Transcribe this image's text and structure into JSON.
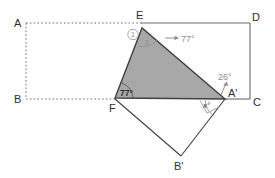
{
  "figure": {
    "colors": {
      "shaded_fill": "#a8a8a8",
      "solid_stroke": "#4a4a4a",
      "dotted_stroke": "#6e6e6e",
      "gray_annotation": "#8c8c8c",
      "label_text": "#2e2e2e",
      "background": "#ffffff"
    },
    "points": [
      {
        "name": "A",
        "label": "A",
        "x": 26,
        "y": 23,
        "label_x": 17,
        "label_y": 26
      },
      {
        "name": "B",
        "label": "B",
        "x": 26,
        "y": 99,
        "label_x": 17,
        "label_y": 102
      },
      {
        "name": "C",
        "label": "C",
        "x": 250,
        "y": 99,
        "label_x": 254,
        "label_y": 105
      },
      {
        "name": "D",
        "label": "D",
        "x": 250,
        "y": 24,
        "label_x": 253,
        "label_y": 21
      },
      {
        "name": "E",
        "label": "E",
        "x": 142,
        "y": 28,
        "label_x": 138,
        "label_y": 19
      },
      {
        "name": "F",
        "label": "F",
        "x": 115,
        "y": 98,
        "label_x": 110,
        "label_y": 110
      },
      {
        "name": "A'",
        "label": "A'",
        "x": 225,
        "y": 99,
        "label_x": 229,
        "label_y": 95
      },
      {
        "name": "B'",
        "label": "B'",
        "x": 181,
        "y": 156,
        "label_x": 175,
        "label_y": 168
      }
    ],
    "annotations": [
      {
        "name": "angle-e-77",
        "text": "77°",
        "x": 181,
        "y": 42
      },
      {
        "name": "angle-f-77",
        "text": "77°",
        "x": 120,
        "y": 96
      },
      {
        "name": "angle-26",
        "text": "26°",
        "x": 221,
        "y": 79
      },
      {
        "name": "angle-x",
        "text": "x°",
        "x": 206,
        "y": 107
      },
      {
        "name": "marker-one",
        "text": "1",
        "x": 133,
        "y": 37
      },
      {
        "name": "marker-two",
        "text": "2",
        "x": 147,
        "y": 45
      }
    ],
    "segments": {
      "dotted": [
        {
          "name": "segment-a-to-e",
          "x1": 26,
          "y1": 23,
          "x2": 142,
          "y2": 23
        },
        {
          "name": "segment-a-to-b",
          "x1": 26,
          "y1": 23,
          "x2": 26,
          "y2": 99
        },
        {
          "name": "segment-b-to-f",
          "x1": 26,
          "y1": 99,
          "x2": 115,
          "y2": 99
        }
      ],
      "solid": [
        {
          "name": "segment-e-to-d",
          "x1": 142,
          "y1": 23,
          "x2": 250,
          "y2": 23
        },
        {
          "name": "segment-d-to-c",
          "x1": 250,
          "y1": 23,
          "x2": 250,
          "y2": 99
        },
        {
          "name": "segment-aprime-to-c",
          "x1": 225,
          "y1": 99,
          "x2": 250,
          "y2": 99
        },
        {
          "name": "segment-f-to-bprime",
          "x1": 115,
          "y1": 99,
          "x2": 181,
          "y2": 156
        },
        {
          "name": "segment-bprime-to-aprime",
          "x1": 181,
          "y1": 156,
          "x2": 225,
          "y2": 99
        }
      ]
    },
    "shaded_triangle": {
      "name": "shaded-triangle-e-f-aprime",
      "points": "142,28 115,98 225,99"
    },
    "arrow_annotations": [
      {
        "name": "arrow-to-77-at-e",
        "x1": 166,
        "y1": 38,
        "x2": 179,
        "y2": 38
      },
      {
        "name": "arrow-to-26",
        "x1": 222,
        "y1": 95,
        "x2": 228,
        "y2": 82
      }
    ],
    "right_angle_marker": {
      "name": "right-angle-marker-at-aprime",
      "points": "201,100 208,113 221,106"
    },
    "arc_markers": [
      {
        "name": "arc-at-f",
        "d": "M 130 98 A 16 16 0 0 0 122 85"
      },
      {
        "name": "arc-at-e",
        "d": "M 139 44 A 16 16 0 0 0 155 39"
      },
      {
        "name": "arc-at-aprime",
        "d": "M 206 99 A 20 20 0 0 0 215 114"
      }
    ]
  }
}
